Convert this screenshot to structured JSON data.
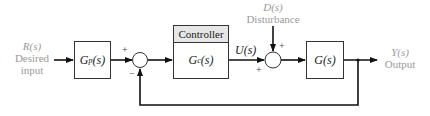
{
  "input": {
    "signal": "R(s)",
    "line1": "Desired",
    "line2": "input"
  },
  "prefilter": {
    "label": "G",
    "sub": "p",
    "arg": "(s)"
  },
  "sum1": {
    "plus": "+",
    "minus": "−"
  },
  "controller": {
    "title": "Controller",
    "label": "G",
    "sub": "c",
    "arg": "(s)"
  },
  "control_signal": {
    "label": "U(s)"
  },
  "disturbance": {
    "signal": "D(s)",
    "label": "Disturbance"
  },
  "sum2": {
    "plus_top": "+",
    "plus_left": "+"
  },
  "plant": {
    "label": "G(s)"
  },
  "output": {
    "signal": "Y(s)",
    "label": "Output"
  },
  "colors": {
    "line": "#111111",
    "text_gray": "#9a9a9a",
    "header_fill": "#e6e6e6"
  }
}
